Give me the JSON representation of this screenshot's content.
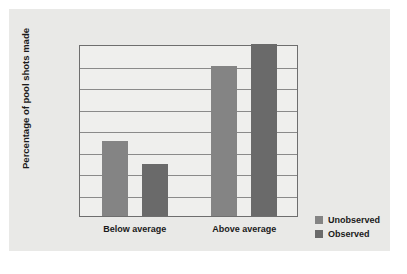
{
  "chart_data": {
    "type": "bar",
    "title": "",
    "xlabel": "",
    "ylabel": "Percentage of pool shots made",
    "categories": [
      "Below average",
      "Above average"
    ],
    "series": [
      {
        "name": "Unobserved",
        "color": "#848484",
        "values": [
          35,
          70
        ]
      },
      {
        "name": "Observed",
        "color": "#6a6a6a",
        "values": [
          24,
          80
        ]
      }
    ],
    "ylim": [
      0,
      80
    ],
    "yticks": [
      0,
      10,
      20,
      30,
      40,
      50,
      60,
      70,
      80
    ],
    "ytick_labels": [
      "0",
      "10",
      "20",
      "30",
      "40",
      "50",
      "60",
      "70",
      "80"
    ],
    "grid": true,
    "legend_position": "right-bottom",
    "legend_entries": [
      "Unobserved",
      "Observed"
    ],
    "panel_background": "#e9e9e7",
    "plot_background": "#efefed",
    "axis_color": "#6e6e6e",
    "grid_color": "#8a8a8a"
  }
}
